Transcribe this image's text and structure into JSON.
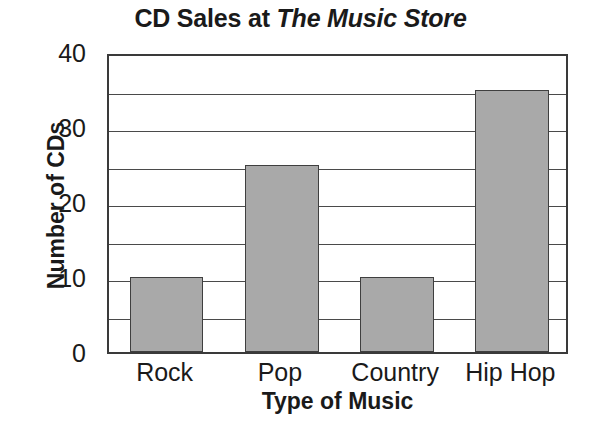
{
  "chart_data": {
    "type": "bar",
    "title": "CD Sales at The Music Store",
    "title_plain": "CD Sales at ",
    "title_emph": "The Music Store",
    "xlabel": "Type of Music",
    "ylabel": "Number of CDs",
    "categories": [
      "Rock",
      "Pop",
      "Country",
      "Hip Hop"
    ],
    "values": [
      10,
      25,
      10,
      35
    ],
    "ylim": [
      0,
      40
    ],
    "ytick_labels": [
      "0",
      "10",
      "20",
      "30",
      "40"
    ],
    "ytick_values": [
      0,
      10,
      20,
      30,
      40
    ],
    "gridline_values": [
      5,
      10,
      15,
      20,
      25,
      30,
      35
    ],
    "grid": true,
    "legend": "none",
    "bar_fill_color": "#a9a9a9",
    "bar_edge_color": "#3f3f3f",
    "axis_color": "#3a3a3a",
    "background_color": "#ffffff"
  }
}
